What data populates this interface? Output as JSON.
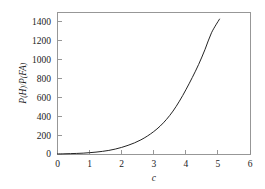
{
  "figure": {
    "background_color": "#ffffff",
    "frame_color": "#8c8c8c",
    "curve_color": "#242424",
    "text_color": "#1b1b1b"
  },
  "chart_data": {
    "type": "line",
    "title": "",
    "subtitle": "",
    "xlabel": "c",
    "ylabel": "P(H)/P(FA)",
    "ylabel_parts": {
      "p1": "P",
      "open1": "(",
      "h": "H",
      "close1": ")",
      "slash": "/",
      "p2": "P",
      "open2": "(",
      "fa": "FA",
      "close2": ")"
    },
    "xlim": [
      0,
      6
    ],
    "ylim": [
      0,
      1500
    ],
    "xticks": [
      0,
      1,
      2,
      3,
      4,
      5,
      6
    ],
    "xticklabels": [
      "0",
      "1",
      "2",
      "3",
      "4",
      "5",
      "6"
    ],
    "yticks": [
      0,
      200,
      400,
      600,
      800,
      1000,
      1200,
      1400
    ],
    "yticklabels": [
      "0",
      "200",
      "400",
      "600",
      "800",
      "1000",
      "1200",
      "1400"
    ],
    "grid": false,
    "legend": null,
    "legend_position": "none",
    "annotations": [],
    "series": [
      {
        "name": "P(H)/P(FA)",
        "color": "#242424",
        "linewidth": 1.0,
        "x": [
          0.0,
          0.2,
          0.4,
          0.6,
          0.8,
          1.0,
          1.2,
          1.4,
          1.6,
          1.8,
          2.0,
          2.2,
          2.4,
          2.6,
          2.8,
          3.0,
          3.2,
          3.4,
          3.6,
          3.8,
          4.0,
          4.2,
          4.4,
          4.6,
          4.8,
          5.05
        ],
        "y": [
          1,
          2,
          4,
          6,
          9,
          14,
          20,
          28,
          38,
          52,
          70,
          92,
          118,
          150,
          190,
          238,
          296,
          368,
          455,
          560,
          680,
          810,
          950,
          1110,
          1285,
          1430
        ]
      }
    ]
  }
}
